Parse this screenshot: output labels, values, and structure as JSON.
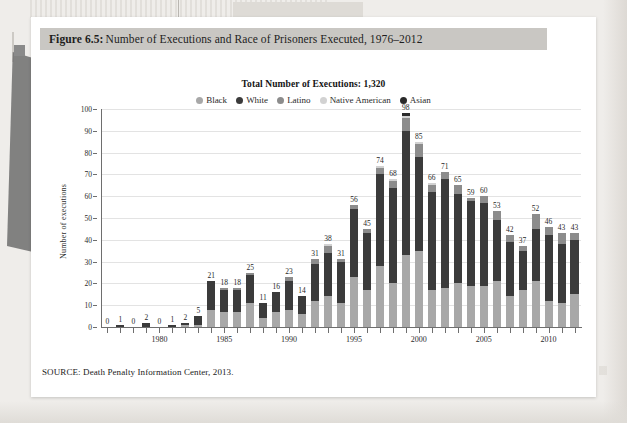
{
  "figure": {
    "number_label": "Figure 6.5:",
    "caption": " Number of Executions and Race of Prisoners Executed, 1976–2012",
    "source_note": "SOURCE: Death Penalty Information Center, 2013."
  },
  "chart_data": {
    "type": "bar",
    "stacked": true,
    "title": "Total Number of Executions: 1,320",
    "xlabel": "",
    "ylabel": "Number of executions",
    "ylim": [
      0,
      100
    ],
    "ytick_step": 10,
    "yticks": [
      0,
      10,
      20,
      30,
      40,
      50,
      60,
      70,
      80,
      90,
      100
    ],
    "grid": true,
    "legend_position": "top-center",
    "xtick_labels": [
      "1980",
      "1985",
      "1990",
      "1995",
      "2000",
      "2005",
      "2010"
    ],
    "xtick_label_years": [
      1980,
      1985,
      1990,
      1995,
      2000,
      2005,
      2010
    ],
    "categories": [
      1976,
      1977,
      1978,
      1979,
      1980,
      1981,
      1982,
      1983,
      1984,
      1985,
      1986,
      1987,
      1988,
      1989,
      1990,
      1991,
      1992,
      1993,
      1994,
      1995,
      1996,
      1997,
      1998,
      1999,
      2000,
      2001,
      2002,
      2003,
      2004,
      2005,
      2006,
      2007,
      2008,
      2009,
      2010,
      2011,
      2012
    ],
    "totals": [
      0,
      1,
      0,
      2,
      0,
      1,
      2,
      5,
      21,
      18,
      18,
      25,
      11,
      16,
      23,
      14,
      31,
      38,
      31,
      56,
      45,
      74,
      68,
      98,
      85,
      66,
      71,
      65,
      59,
      60,
      53,
      42,
      37,
      52,
      46,
      43,
      43
    ],
    "total_labels": [
      "0",
      "1",
      "0",
      "2",
      "0",
      "1",
      "2",
      "5",
      "21",
      "18",
      "18",
      "25",
      "11",
      "16",
      "23",
      "14",
      "31",
      "38",
      "31",
      "56",
      "45",
      "74",
      "68",
      "98",
      "85",
      "66",
      "71",
      "65",
      "59",
      "60",
      "53",
      "42",
      "37",
      "52",
      "46",
      "43",
      "43"
    ],
    "series": [
      {
        "name": "Black",
        "color": "#a8a8a8",
        "values": [
          0,
          0,
          0,
          0,
          0,
          0,
          1,
          1,
          8,
          7,
          7,
          11,
          4,
          7,
          8,
          6,
          12,
          14,
          11,
          23,
          17,
          28,
          20,
          33,
          35,
          17,
          18,
          20,
          19,
          19,
          21,
          14,
          17,
          21,
          12,
          11,
          15
        ]
      },
      {
        "name": "White",
        "color": "#3b3b3b",
        "values": [
          0,
          1,
          0,
          2,
          0,
          1,
          1,
          4,
          13,
          10,
          10,
          13,
          7,
          9,
          13,
          8,
          17,
          20,
          19,
          31,
          26,
          42,
          44,
          57,
          43,
          45,
          50,
          41,
          39,
          38,
          28,
          25,
          18,
          24,
          30,
          27,
          25
        ]
      },
      {
        "name": "Latino",
        "color": "#8c8c8c",
        "values": [
          0,
          0,
          0,
          0,
          0,
          0,
          0,
          0,
          0,
          1,
          1,
          1,
          0,
          0,
          2,
          0,
          2,
          3,
          1,
          2,
          2,
          3,
          3,
          6,
          6,
          3,
          3,
          4,
          1,
          3,
          4,
          3,
          2,
          7,
          4,
          5,
          3
        ]
      },
      {
        "name": "Native American",
        "color": "#d2d2d2",
        "values": [
          0,
          0,
          0,
          0,
          0,
          0,
          0,
          0,
          0,
          0,
          0,
          0,
          0,
          0,
          0,
          0,
          0,
          1,
          0,
          0,
          0,
          1,
          1,
          1,
          1,
          1,
          0,
          0,
          0,
          0,
          0,
          0,
          0,
          0,
          0,
          0,
          0
        ]
      },
      {
        "name": "Asian",
        "color": "#2a2a2a",
        "values": [
          0,
          0,
          0,
          0,
          0,
          0,
          0,
          0,
          0,
          0,
          0,
          0,
          0,
          0,
          0,
          0,
          0,
          0,
          0,
          0,
          0,
          0,
          0,
          1,
          0,
          0,
          0,
          0,
          0,
          0,
          0,
          0,
          0,
          0,
          0,
          0,
          0
        ]
      }
    ]
  }
}
